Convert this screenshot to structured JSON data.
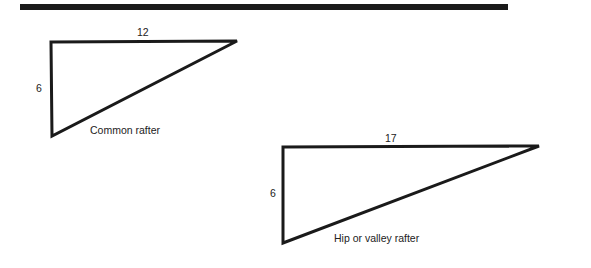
{
  "header_rule": {
    "x1": 20,
    "x2": 508,
    "y": 7,
    "thickness": 6,
    "color": "#1a1a1a"
  },
  "diagrams": [
    {
      "name": "common-rafter",
      "caption": "Common rafter",
      "run_label": "12",
      "rise_label": "6",
      "vertices": {
        "top_left": [
          51,
          42
        ],
        "top_right": [
          237,
          41
        ],
        "bottom": [
          52,
          136
        ]
      },
      "labels": {
        "run": {
          "x": 137,
          "y": 26
        },
        "rise": {
          "x": 36,
          "y": 82
        },
        "caption": {
          "x": 90,
          "y": 124
        }
      }
    },
    {
      "name": "hip-or-valley-rafter",
      "caption": "Hip or valley rafter",
      "run_label": "17",
      "rise_label": "6",
      "vertices": {
        "top_left": [
          283,
          147
        ],
        "top_right": [
          539,
          146
        ],
        "bottom": [
          283,
          243
        ]
      },
      "labels": {
        "run": {
          "x": 385,
          "y": 132
        },
        "rise": {
          "x": 270,
          "y": 187
        },
        "caption": {
          "x": 334,
          "y": 232
        }
      }
    }
  ],
  "stroke": {
    "color": "#1a1a1a",
    "width": 3
  }
}
